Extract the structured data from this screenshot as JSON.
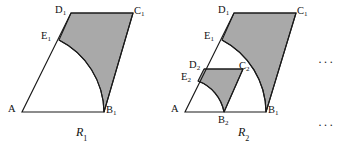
{
  "figure": {
    "background_color": "#ffffff",
    "shade_color": "#a9a9a9",
    "stroke_color": "#1a1a1a"
  },
  "panels": [
    {
      "id": "R1",
      "caption": "R",
      "caption_sub": "1",
      "vertices": {
        "A": {
          "label": "A",
          "sub": "",
          "x": 22,
          "y": 112
        },
        "B1": {
          "label": "B",
          "sub": "1",
          "x": 104,
          "y": 112
        },
        "C1": {
          "label": "C",
          "sub": "1",
          "x": 133,
          "y": 13
        },
        "D1": {
          "label": "D",
          "sub": "1",
          "x": 71,
          "y": 13
        },
        "E1": {
          "label": "E",
          "sub": "1",
          "x": 59,
          "y": 40
        }
      }
    },
    {
      "id": "R2",
      "caption": "R",
      "caption_sub": "2",
      "vertices": {
        "A": {
          "label": "A",
          "sub": "",
          "x": 185,
          "y": 112
        },
        "B2": {
          "label": "B",
          "sub": "2",
          "x": 224,
          "y": 112
        },
        "B1": {
          "label": "B",
          "sub": "1",
          "x": 266,
          "y": 112
        },
        "C1": {
          "label": "C",
          "sub": "1",
          "x": 296,
          "y": 13
        },
        "D1": {
          "label": "D",
          "sub": "1",
          "x": 234,
          "y": 13
        },
        "E1": {
          "label": "E",
          "sub": "1",
          "x": 222,
          "y": 40
        },
        "D2": {
          "label": "D",
          "sub": "2",
          "x": 204,
          "y": 69
        },
        "C2": {
          "label": "C",
          "sub": "2",
          "x": 243,
          "y": 69
        },
        "E2": {
          "label": "E",
          "sub": "2",
          "x": 198,
          "y": 81
        }
      }
    }
  ],
  "ellipses": [
    {
      "id": "dots-upper",
      "text": "···",
      "x": 318,
      "y": 56
    },
    {
      "id": "dots-lower",
      "text": "···",
      "x": 318,
      "y": 119
    }
  ],
  "labels": {
    "R1_A": "A",
    "R1_B1": "B",
    "R1_C1": "C",
    "R1_D1": "D",
    "R1_E1": "E",
    "R2_A": "A",
    "R2_B2": "B",
    "R2_B1": "B",
    "R2_C1": "C",
    "R2_D1": "D",
    "R2_E1": "E",
    "R2_D2": "D",
    "R2_C2": "C",
    "R2_E2": "E"
  },
  "subs": {
    "one": "1",
    "two": "2",
    "none": ""
  }
}
